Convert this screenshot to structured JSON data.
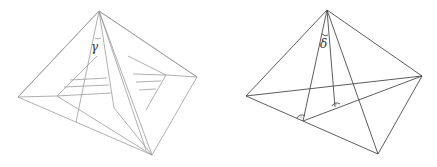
{
  "figures": [
    {
      "id": "left",
      "label": "γ",
      "label_pos": [
        93,
        51
      ],
      "stroke": "#9a9a9a",
      "outer": {
        "apex": [
          99,
          11
        ],
        "left": [
          18,
          97
        ],
        "right": [
          197,
          77
        ],
        "bottom": [
          152,
          155
        ]
      }
    },
    {
      "id": "right",
      "label": "δ",
      "label_pos": [
        320,
        48
      ],
      "stroke": "#4a4a4a",
      "outer": {
        "apex": [
          327,
          10
        ],
        "left": [
          246,
          96
        ],
        "right": [
          422,
          76
        ],
        "bottom": [
          378,
          154
        ]
      },
      "right_angle_marks": [
        [
          303,
          119
        ],
        [
          337,
          106
        ]
      ]
    }
  ]
}
